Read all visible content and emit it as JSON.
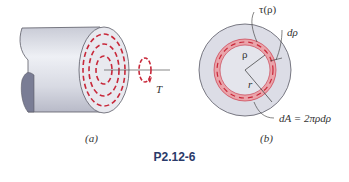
{
  "figure": {
    "caption": "P2.12-6",
    "panel_a": {
      "label": "(a)",
      "torque_label": "T"
    },
    "panel_b": {
      "label": "(b)",
      "shear_label": "τ(ρ)",
      "drho_label": "dρ",
      "rho_label": "ρ",
      "r_label": "r",
      "area_label": "dA = 2πρdρ"
    },
    "colors": {
      "shaft_fill": "#dcdde6",
      "shaft_edge": "#5a5a66",
      "end_face": "#e8e9ef",
      "hollow": "#7a7d95",
      "stress_red": "#c8283a",
      "ring_fill": "#eaa4aa",
      "caption_color": "#2a3a6a"
    }
  }
}
